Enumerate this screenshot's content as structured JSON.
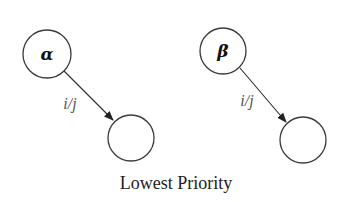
{
  "diagram": {
    "caption": "Lowest Priority",
    "left": {
      "source_label": "α",
      "target_label": "",
      "edge_label": "i/j"
    },
    "right": {
      "source_label": "β",
      "target_label": "",
      "edge_label": "i/j"
    },
    "colors": {
      "stroke": "#3a3a3a",
      "edge_label": "#555555",
      "text": "#222222",
      "background": "#ffffff"
    }
  }
}
